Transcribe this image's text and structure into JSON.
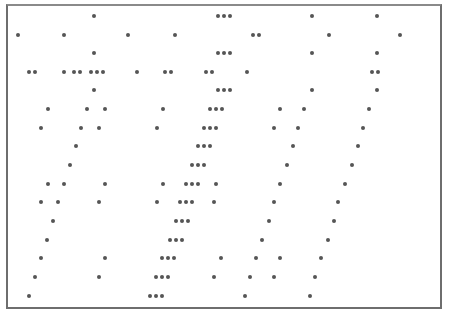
{
  "canvas": {
    "description": "Asterisk pattern inside bordered frame",
    "glyph": "*",
    "star_color": "#555555",
    "border_color": "#6e6e6e"
  },
  "rows": [
    {
      "y": 16,
      "x": [
        94,
        218,
        224,
        230,
        312,
        377
      ]
    },
    {
      "y": 35,
      "x": [
        18,
        64,
        128,
        175,
        253,
        259,
        329,
        400
      ]
    },
    {
      "y": 53,
      "x": [
        94,
        218,
        224,
        230,
        312,
        377
      ]
    },
    {
      "y": 72,
      "x": [
        29,
        35,
        64,
        74,
        80,
        91,
        97,
        103,
        137,
        165,
        171,
        206,
        212,
        247,
        372,
        378
      ]
    },
    {
      "y": 90,
      "x": [
        94,
        218,
        224,
        230,
        312,
        377
      ]
    },
    {
      "y": 109,
      "x": [
        48,
        87,
        105,
        163,
        210,
        216,
        222,
        280,
        304,
        369
      ]
    },
    {
      "y": 128,
      "x": [
        41,
        81,
        99,
        157,
        204,
        210,
        216,
        274,
        298,
        363
      ]
    },
    {
      "y": 146,
      "x": [
        76,
        198,
        204,
        210,
        293,
        358
      ]
    },
    {
      "y": 165,
      "x": [
        70,
        192,
        198,
        204,
        287,
        352
      ]
    },
    {
      "y": 184,
      "x": [
        48,
        64,
        105,
        163,
        186,
        192,
        198,
        216,
        280,
        345
      ]
    },
    {
      "y": 202,
      "x": [
        41,
        58,
        99,
        157,
        180,
        186,
        192,
        214,
        274,
        338
      ]
    },
    {
      "y": 221,
      "x": [
        53,
        176,
        182,
        188,
        269,
        334
      ]
    },
    {
      "y": 240,
      "x": [
        47,
        170,
        176,
        182,
        262,
        328
      ]
    },
    {
      "y": 258,
      "x": [
        41,
        105,
        162,
        168,
        174,
        221,
        256,
        280,
        321
      ]
    },
    {
      "y": 277,
      "x": [
        35,
        99,
        156,
        162,
        168,
        214,
        250,
        274,
        315
      ]
    },
    {
      "y": 296,
      "x": [
        29,
        150,
        156,
        162,
        245,
        310
      ]
    }
  ]
}
